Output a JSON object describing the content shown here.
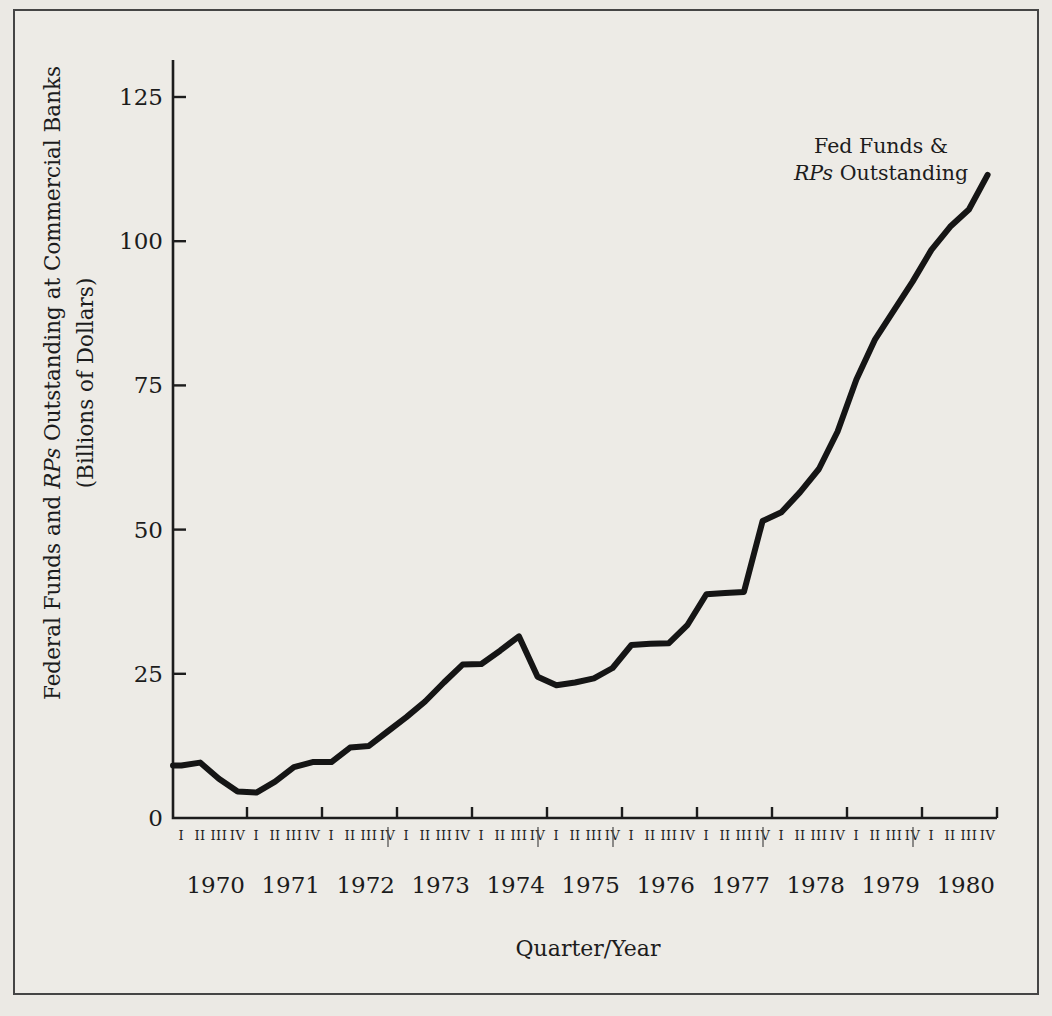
{
  "page": {
    "background_color": "#ebe9e4",
    "frame_color": "#454545",
    "text_color": "#1c1c1c"
  },
  "chart_data": {
    "type": "line",
    "title": "",
    "xlabel": "Quarter/Year",
    "ylabel_line1_parts": [
      "Federal Funds and ",
      "RPs",
      " Outstanding at Commercial Banks"
    ],
    "ylabel_line2": "(Billions of Dollars)",
    "annotation_line1": "Fed Funds &",
    "annotation_line2_parts": [
      "RPs",
      " Outstanding"
    ],
    "line_color": "#151515",
    "axis_color": "#1c1c1c",
    "ylim": [
      0,
      131
    ],
    "grid": false,
    "legend_position": "top-right-annotation",
    "y_ticks": [
      0,
      25,
      50,
      75,
      100,
      125
    ],
    "years": [
      "1970",
      "1971",
      "1972",
      "1973",
      "1974",
      "1975",
      "1976",
      "1977",
      "1978",
      "1979",
      "1980"
    ],
    "quarter_labels": [
      "I",
      "II",
      "III",
      "IV"
    ],
    "separator_boundaries": [
      3,
      5,
      6,
      8,
      10
    ],
    "series": [
      {
        "name": "Fed Funds & RPs Outstanding",
        "x_unit": "quarter",
        "x_start": "1970 Q1",
        "x_end": "1980 Q4",
        "values": [
          9.1,
          9.6,
          6.8,
          4.6,
          4.4,
          6.3,
          8.8,
          9.7,
          9.7,
          12.2,
          12.5,
          15.0,
          17.5,
          20.2,
          23.5,
          26.6,
          26.7,
          29.0,
          31.5,
          24.5,
          23.0,
          23.5,
          24.2,
          26.0,
          30.0,
          30.2,
          30.3,
          33.5,
          38.8,
          39.0,
          39.2,
          51.5,
          53.0,
          56.5,
          60.5,
          67.0,
          76.0,
          83.0,
          88.0,
          93.0,
          98.5,
          102.5,
          105.5,
          111.5
        ]
      }
    ]
  }
}
